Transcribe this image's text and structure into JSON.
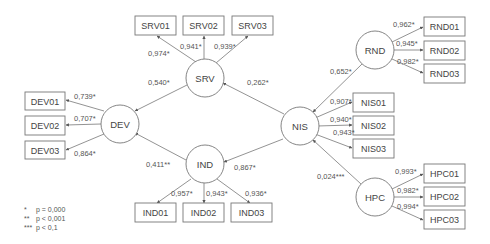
{
  "diagram": {
    "constructs": [
      {
        "id": "SRV",
        "label": "SRV"
      },
      {
        "id": "DEV",
        "label": "DEV"
      },
      {
        "id": "IND",
        "label": "IND"
      },
      {
        "id": "NIS",
        "label": "NIS"
      },
      {
        "id": "RND",
        "label": "RND"
      },
      {
        "id": "HPC",
        "label": "HPC"
      }
    ],
    "indicators": {
      "SRV": [
        {
          "label": "SRV01",
          "loading": "0,974*"
        },
        {
          "label": "SRV02",
          "loading": "0,941*"
        },
        {
          "label": "SRV03",
          "loading": "0,939*"
        }
      ],
      "DEV": [
        {
          "label": "DEV01",
          "loading": "0,739*"
        },
        {
          "label": "DEV02",
          "loading": "0,707*"
        },
        {
          "label": "DEV03",
          "loading": "0,864*"
        }
      ],
      "IND": [
        {
          "label": "IND01",
          "loading": "0,957*"
        },
        {
          "label": "IND02",
          "loading": "0,943*"
        },
        {
          "label": "IND03",
          "loading": "0,936*"
        }
      ],
      "NIS": [
        {
          "label": "NIS01",
          "loading": "0,907*"
        },
        {
          "label": "NIS02",
          "loading": "0,940*"
        },
        {
          "label": "NIS03",
          "loading": "0,943*"
        }
      ],
      "RND": [
        {
          "label": "RND01",
          "loading": "0,962*"
        },
        {
          "label": "RND02",
          "loading": "0,945*"
        },
        {
          "label": "RND03",
          "loading": "0,982*"
        }
      ],
      "HPC": [
        {
          "label": "HPC01",
          "loading": "0,993*"
        },
        {
          "label": "HPC02",
          "loading": "0,982*"
        },
        {
          "label": "HPC03",
          "loading": "0,994*"
        }
      ]
    },
    "paths": [
      {
        "from": "SRV",
        "to": "DEV",
        "coef": "0,540*"
      },
      {
        "from": "NIS",
        "to": "SRV",
        "coef": "0,262*"
      },
      {
        "from": "IND",
        "to": "DEV",
        "coef": "0,411**"
      },
      {
        "from": "NIS",
        "to": "IND",
        "coef": "0,867*"
      },
      {
        "from": "RND",
        "to": "NIS",
        "coef": "0,652*"
      },
      {
        "from": "HPC",
        "to": "NIS",
        "coef": "0,024***"
      }
    ],
    "legend": [
      {
        "symbol": "*",
        "text": "p = 0,000"
      },
      {
        "symbol": "**",
        "text": "p < 0,001"
      },
      {
        "symbol": "***",
        "text": "p < 0,1"
      }
    ]
  }
}
